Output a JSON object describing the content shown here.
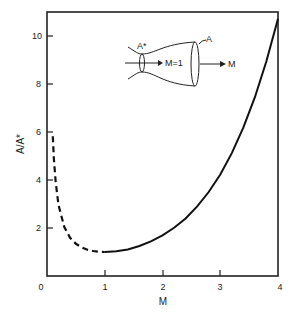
{
  "chart_data": {
    "type": "line",
    "title": "",
    "xlabel": "M",
    "ylabel": "A/A*",
    "xlim": [
      0,
      4
    ],
    "ylim": [
      0,
      11
    ],
    "x_ticks": [
      "0",
      "1",
      "2",
      "3",
      "4"
    ],
    "y_ticks": [
      "2",
      "4",
      "6",
      "8",
      "10"
    ],
    "grid": false,
    "legend": null,
    "series": [
      {
        "name": "subsonic (dashed)",
        "style": "dashed",
        "x": [
          0.1,
          0.12,
          0.15,
          0.2,
          0.3,
          0.4,
          0.5,
          0.6,
          0.7,
          0.8,
          0.9,
          1.0
        ],
        "y": [
          5.82,
          4.87,
          3.91,
          2.96,
          2.04,
          1.59,
          1.34,
          1.19,
          1.09,
          1.04,
          1.01,
          1.0
        ]
      },
      {
        "name": "supersonic (solid)",
        "style": "solid",
        "x": [
          1.0,
          1.2,
          1.4,
          1.6,
          1.8,
          2.0,
          2.2,
          2.4,
          2.6,
          2.8,
          3.0,
          3.2,
          3.4,
          3.6,
          3.8,
          4.0
        ],
        "y": [
          1.0,
          1.03,
          1.11,
          1.25,
          1.44,
          1.69,
          2.01,
          2.4,
          2.9,
          3.5,
          4.23,
          5.12,
          6.18,
          7.45,
          8.95,
          10.72
        ]
      }
    ],
    "inset": {
      "description": "converging-diverging nozzle sketch",
      "throat_label": "A*",
      "throat_flow_label": "M=1",
      "exit_label": "A",
      "exit_flow_label": "M"
    }
  }
}
